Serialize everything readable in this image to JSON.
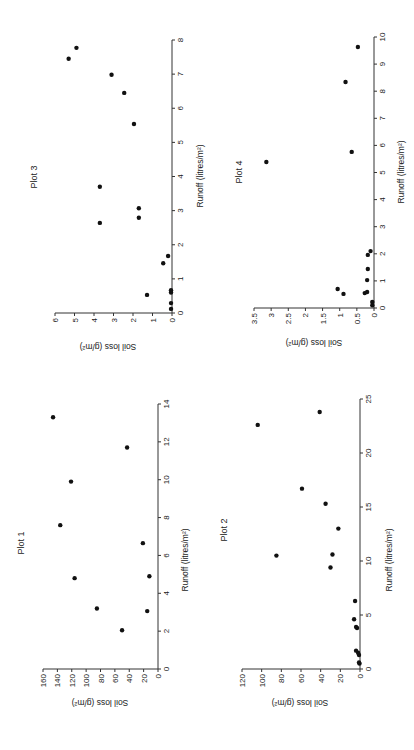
{
  "page": {
    "orientation_note": "All four plots are printed rotated 90 degrees counter-clockwise on the page",
    "colors": {
      "background": "#ffffff",
      "ink": "#111111",
      "axis": "#333333"
    }
  },
  "chart_data": [
    {
      "id": "plot1",
      "type": "scatter",
      "title": "Plot 1",
      "xlabel": "Runoff (litres/m²)",
      "ylabel": "Soil loss (g/m²)",
      "xlim": [
        0,
        14
      ],
      "ylim": [
        0,
        160
      ],
      "xticks": [
        0,
        2,
        4,
        6,
        8,
        10,
        12,
        14
      ],
      "yticks": [
        0,
        20,
        40,
        60,
        80,
        100,
        120,
        140,
        160
      ],
      "grid": false,
      "layout": {
        "origin": [
          158,
          669
        ],
        "x_end_y": 404,
        "y_end_x": 43,
        "title_pos": [
          24,
          543
        ],
        "xlabel_pos": [
          188,
          560
        ],
        "ylabel_pos": [
          100,
          700
        ]
      },
      "x": [
        2.05,
        3.06,
        3.2,
        4.8,
        4.9,
        6.65,
        7.6,
        9.9,
        11.7,
        13.3
      ],
      "y": [
        50,
        15,
        85,
        116,
        12,
        21,
        136,
        121,
        43,
        146
      ]
    },
    {
      "id": "plot2",
      "type": "scatter",
      "title": "Plot 2",
      "xlabel": "Runoff (litres/m²)",
      "ylabel": "Soil loss (g/m²)",
      "xlim": [
        0,
        25
      ],
      "ylim": [
        0,
        120
      ],
      "xticks": [
        0,
        5,
        10,
        15,
        20,
        25
      ],
      "yticks": [
        0,
        20,
        40,
        60,
        80,
        100,
        120
      ],
      "grid": false,
      "layout": {
        "origin": [
          360,
          669
        ],
        "x_end_y": 399,
        "y_end_x": 242,
        "title_pos": [
          227,
          530
        ],
        "xlabel_pos": [
          392,
          560
        ],
        "ylabel_pos": [
          300,
          700
        ]
      },
      "x": [
        0.5,
        0.6,
        1.3,
        1.5,
        1.7,
        3.8,
        3.9,
        4.6,
        6.3,
        9.4,
        10.5,
        10.6,
        13.0,
        15.3,
        16.7,
        22.6,
        23.8
      ],
      "y": [
        0.5,
        1,
        1,
        2,
        4,
        3,
        4,
        6,
        5,
        30,
        85,
        28,
        22,
        35,
        59,
        104,
        41
      ]
    },
    {
      "id": "plot3",
      "type": "scatter",
      "title": "Plot 3",
      "xlabel": "Runoff (litres/m²)",
      "ylabel": "Soil loss (g/m²)",
      "xlim": [
        0,
        8
      ],
      "ylim": [
        0,
        6
      ],
      "xticks": [
        0,
        1,
        2,
        3,
        4,
        5,
        6,
        7,
        8
      ],
      "yticks": [
        0,
        1,
        2,
        3,
        4,
        5,
        6
      ],
      "grid": false,
      "layout": {
        "origin": [
          172,
          313
        ],
        "x_end_y": 40,
        "y_end_x": 55,
        "title_pos": [
          37,
          177
        ],
        "xlabel_pos": [
          203,
          176
        ],
        "ylabel_pos": [
          108,
          344
        ]
      },
      "x": [
        0.12,
        0.29,
        0.53,
        0.6,
        0.67,
        1.46,
        1.67,
        2.64,
        2.79,
        3.07,
        3.7,
        5.54,
        6.45,
        6.98,
        7.45,
        7.77
      ],
      "y": [
        0.05,
        0.05,
        1.28,
        0.05,
        0.05,
        0.45,
        0.2,
        3.7,
        1.7,
        1.7,
        3.7,
        1.95,
        2.45,
        3.1,
        5.3,
        4.9
      ]
    },
    {
      "id": "plot4",
      "type": "scatter",
      "title": "Plot 4",
      "xlabel": "Runoff (litres/m²)",
      "ylabel": "Soil loss (g/m²)",
      "xlim": [
        0,
        10
      ],
      "ylim": [
        0,
        3.5
      ],
      "xticks": [
        0,
        1,
        2,
        3,
        4,
        5,
        6,
        7,
        8,
        9,
        10
      ],
      "yticks": [
        0,
        0.5,
        1,
        1.5,
        2,
        2.5,
        3,
        3.5
      ],
      "grid": false,
      "layout": {
        "origin": [
          374,
          308
        ],
        "x_end_y": 37,
        "y_end_x": 254,
        "title_pos": [
          242,
          172
        ],
        "xlabel_pos": [
          404,
          172
        ],
        "ylabel_pos": [
          314,
          340
        ]
      },
      "x": [
        0.1,
        0.22,
        0.52,
        0.55,
        0.59,
        0.7,
        1.03,
        1.44,
        1.96,
        2.1,
        5.39,
        5.76,
        8.34,
        9.63
      ],
      "y": [
        0.05,
        0.05,
        0.89,
        0.27,
        0.2,
        1.06,
        0.2,
        0.18,
        0.18,
        0.1,
        3.14,
        0.65,
        0.83,
        0.47
      ]
    }
  ]
}
